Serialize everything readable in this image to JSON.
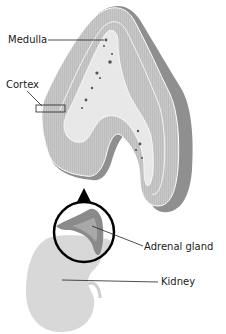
{
  "diagram": {
    "labels": {
      "medulla": "Medulla",
      "cortex": "Cortex",
      "adrenal_gland": "Adrenal gland",
      "kidney": "Kidney"
    },
    "colors": {
      "cortex_fill": "#c8c8c8",
      "medulla_fill": "#e6e6e6",
      "outer_capsule": "#9a9a9a",
      "kidney_fill": "#d9d9d9",
      "adrenal_fill": "#8a8a8a",
      "arrow": "#000000",
      "magnifier_ring": "#000000"
    }
  }
}
